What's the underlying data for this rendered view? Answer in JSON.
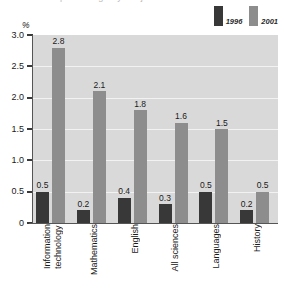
{
  "title_remnant": "percentage by subject",
  "axis": {
    "y_unit": "%",
    "y_ticks": [
      "3.0",
      "2.5",
      "2.0",
      "1.5",
      "1.0",
      "0.5",
      "0"
    ]
  },
  "legend": {
    "items": [
      {
        "label": "1996",
        "color": "#383838",
        "name": "legend-swatch-1996"
      },
      {
        "label": "2001",
        "color": "#8d8d8d",
        "name": "legend-swatch-2001"
      }
    ]
  },
  "chart_data": {
    "type": "bar",
    "title": "",
    "xlabel": "",
    "ylabel": "%",
    "ylim": [
      0,
      3.0
    ],
    "ytick_step": 0.5,
    "grid": true,
    "legend_position": "top-right",
    "categories": [
      "Information\ntechnology",
      "Mathematics",
      "English",
      "All sciences",
      "Languages",
      "History"
    ],
    "series": [
      {
        "name": "1996",
        "color": "#383838",
        "values": [
          0.5,
          0.2,
          0.4,
          0.3,
          0.5,
          0.2
        ],
        "labels": [
          "0.5",
          "0.2",
          "0.4",
          "0.3",
          "0.5",
          "0.2"
        ]
      },
      {
        "name": "2001",
        "color": "#8d8d8d",
        "values": [
          2.8,
          2.1,
          1.8,
          1.6,
          1.5,
          0.5
        ],
        "labels": [
          "2.8",
          "2.1",
          "1.8",
          "1.6",
          "1.5",
          "0.5"
        ]
      }
    ]
  },
  "colors": {
    "plot_background": "#d9d9d9",
    "gridline": "#f2f2f2",
    "axis": "#555555",
    "page_background": "#ffffff"
  }
}
